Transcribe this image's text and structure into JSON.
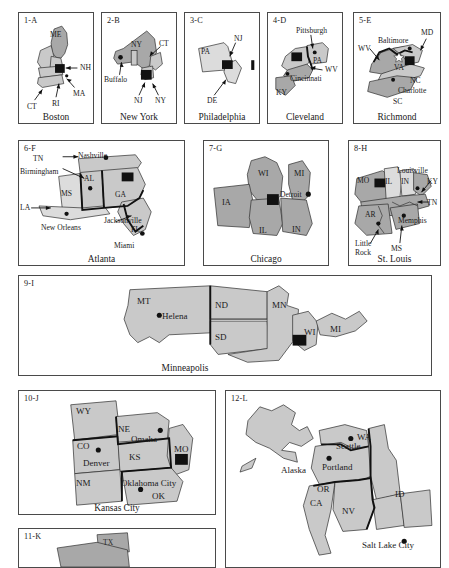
{
  "figure": {
    "panel_count": 12,
    "colors": {
      "state_fill": "#c9c9c9",
      "state_fill_dark": "#a8a8a8",
      "state_fill_light": "#dcdcdc",
      "outline": "#2b2b2b",
      "border": "#4a4a4a",
      "marker": "#111111",
      "background": "#ffffff"
    }
  },
  "panels": [
    {
      "id": "1-A",
      "city": "Boston",
      "marker": "square",
      "states": [
        "ME",
        "NH",
        "MA",
        "RI",
        "CT",
        "VT"
      ],
      "labels": [
        {
          "text": "ME"
        },
        {
          "text": "NH"
        },
        {
          "text": "MA"
        },
        {
          "text": "RI"
        },
        {
          "text": "CT"
        }
      ]
    },
    {
      "id": "2-B",
      "city": "New York",
      "marker": "square",
      "states": [
        "NY",
        "CT",
        "NJ"
      ],
      "labels": [
        {
          "text": "NY"
        },
        {
          "text": "CT"
        },
        {
          "text": "Buffalo"
        },
        {
          "text": "NJ"
        },
        {
          "text": "NY"
        }
      ]
    },
    {
      "id": "3-C",
      "city": "Philadelphia",
      "marker": "square",
      "states": [
        "PA",
        "NJ",
        "DE"
      ],
      "labels": [
        {
          "text": "PA"
        },
        {
          "text": "NJ"
        },
        {
          "text": "DE"
        }
      ]
    },
    {
      "id": "4-D",
      "city": "Cleveland",
      "marker": "square",
      "states": [
        "OH",
        "PA",
        "WV",
        "KY"
      ],
      "labels": [
        {
          "text": "Pittsburgh"
        },
        {
          "text": "PA"
        },
        {
          "text": "WV"
        },
        {
          "text": "Cincinnati"
        },
        {
          "text": "KY"
        }
      ]
    },
    {
      "id": "5-E",
      "city": "Richmond",
      "marker": "square",
      "states": [
        "VA",
        "WV",
        "MD",
        "NC",
        "SC"
      ],
      "labels": [
        {
          "text": "WV"
        },
        {
          "text": "Baltimore"
        },
        {
          "text": "MD"
        },
        {
          "text": "VA"
        },
        {
          "text": "NC"
        },
        {
          "text": "Charlotte"
        },
        {
          "text": "SC"
        }
      ]
    },
    {
      "id": "6-F",
      "city": "Atlanta",
      "marker": "square",
      "states": [
        "TN",
        "AL",
        "MS",
        "LA",
        "GA",
        "FL"
      ],
      "labels": [
        {
          "text": "TN"
        },
        {
          "text": "Nashville"
        },
        {
          "text": "Birmingham"
        },
        {
          "text": "AL"
        },
        {
          "text": "MS"
        },
        {
          "text": "LA"
        },
        {
          "text": "New Orleans"
        },
        {
          "text": "GA"
        },
        {
          "text": "Jacksonville"
        },
        {
          "text": "FL"
        },
        {
          "text": "Miami"
        }
      ]
    },
    {
      "id": "7-G",
      "city": "Chicago",
      "marker": "square",
      "states": [
        "WI",
        "MI",
        "IA",
        "IL",
        "IN"
      ],
      "labels": [
        {
          "text": "WI"
        },
        {
          "text": "MI"
        },
        {
          "text": "Detroit"
        },
        {
          "text": "IA"
        },
        {
          "text": "IL"
        },
        {
          "text": "IN"
        }
      ]
    },
    {
      "id": "8-H",
      "city": "St. Louis",
      "marker": "square",
      "states": [
        "MO",
        "IL",
        "IN",
        "KY",
        "TN",
        "AR",
        "MS"
      ],
      "labels": [
        {
          "text": "Louisville"
        },
        {
          "text": "MO"
        },
        {
          "text": "IL"
        },
        {
          "text": "IN"
        },
        {
          "text": "KY"
        },
        {
          "text": "TN"
        },
        {
          "text": "AR"
        },
        {
          "text": "Memphis"
        },
        {
          "text": "Little"
        },
        {
          "text": "Rock"
        },
        {
          "text": "MS"
        }
      ]
    },
    {
      "id": "9-I",
      "city": "Minneapolis",
      "marker": "square",
      "states": [
        "MT",
        "ND",
        "SD",
        "MN",
        "WI",
        "MI"
      ],
      "labels": [
        {
          "text": "MT"
        },
        {
          "text": "Helena"
        },
        {
          "text": "ND"
        },
        {
          "text": "MN"
        },
        {
          "text": "SD"
        },
        {
          "text": "WI"
        },
        {
          "text": "MI"
        }
      ]
    },
    {
      "id": "10-J",
      "city": "Kansas City",
      "marker": "square",
      "states": [
        "WY",
        "NE",
        "CO",
        "KS",
        "MO",
        "NM",
        "OK"
      ],
      "labels": [
        {
          "text": "WY"
        },
        {
          "text": "NE"
        },
        {
          "text": "Omaha"
        },
        {
          "text": "CO"
        },
        {
          "text": "KS"
        },
        {
          "text": "MO"
        },
        {
          "text": "Denver"
        },
        {
          "text": "NM"
        },
        {
          "text": "Oklahoma City"
        },
        {
          "text": "OK"
        }
      ]
    },
    {
      "id": "11-K",
      "city": "",
      "marker": "square",
      "states": [
        "TX"
      ],
      "labels": [
        {
          "text": "TX"
        }
      ]
    },
    {
      "id": "12-L",
      "city": "",
      "marker": "square",
      "states": [
        "AK",
        "WA",
        "OR",
        "ID",
        "CA",
        "NV",
        "UT"
      ],
      "labels": [
        {
          "text": "Alaska"
        },
        {
          "text": "WA"
        },
        {
          "text": "Seattle"
        },
        {
          "text": "Portland"
        },
        {
          "text": "OR"
        },
        {
          "text": "CA"
        },
        {
          "text": "NV"
        },
        {
          "text": "ID"
        },
        {
          "text": "Salt Lake City"
        }
      ]
    }
  ]
}
